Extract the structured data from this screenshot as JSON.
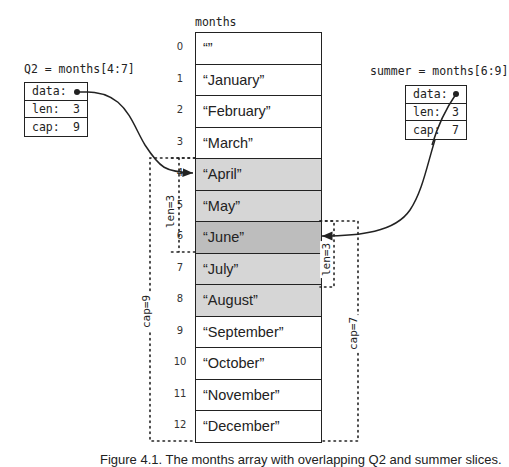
{
  "array": {
    "name": "months",
    "cells": [
      {
        "index": "0",
        "value": "“”",
        "shade": "none"
      },
      {
        "index": "1",
        "value": "“January”",
        "shade": "none"
      },
      {
        "index": "2",
        "value": "“February”",
        "shade": "none"
      },
      {
        "index": "3",
        "value": "“March”",
        "shade": "none"
      },
      {
        "index": "4",
        "value": "“April”",
        "shade": "light"
      },
      {
        "index": "5",
        "value": "“May”",
        "shade": "light"
      },
      {
        "index": "6",
        "value": "“June”",
        "shade": "dark"
      },
      {
        "index": "7",
        "value": "“July”",
        "shade": "light"
      },
      {
        "index": "8",
        "value": "“August”",
        "shade": "light"
      },
      {
        "index": "9",
        "value": "“September”",
        "shade": "none"
      },
      {
        "index": "10",
        "value": "“October”",
        "shade": "none"
      },
      {
        "index": "11",
        "value": "“November”",
        "shade": "none"
      },
      {
        "index": "12",
        "value": "“December”",
        "shade": "none"
      }
    ]
  },
  "slices": {
    "q2": {
      "title": "Q2 = months[4:7]",
      "data_label": "data:",
      "len_label": "len:",
      "len_value": "3",
      "cap_label": "cap:",
      "cap_value": "9",
      "len_bracket": "len=3",
      "cap_bracket": "cap=9"
    },
    "summer": {
      "title": "summer = months[6:9]",
      "data_label": "data:",
      "len_label": "len:",
      "len_value": "3",
      "cap_label": "cap:",
      "cap_value": "7",
      "len_bracket": "len=3",
      "cap_bracket": "cap=7"
    }
  },
  "colors": {
    "light_shade": "#d6d6d6",
    "dark_shade": "#bdbdbd",
    "line": "#222222"
  },
  "caption": "Figure 4.1. The months array with overlapping Q2 and summer slices."
}
